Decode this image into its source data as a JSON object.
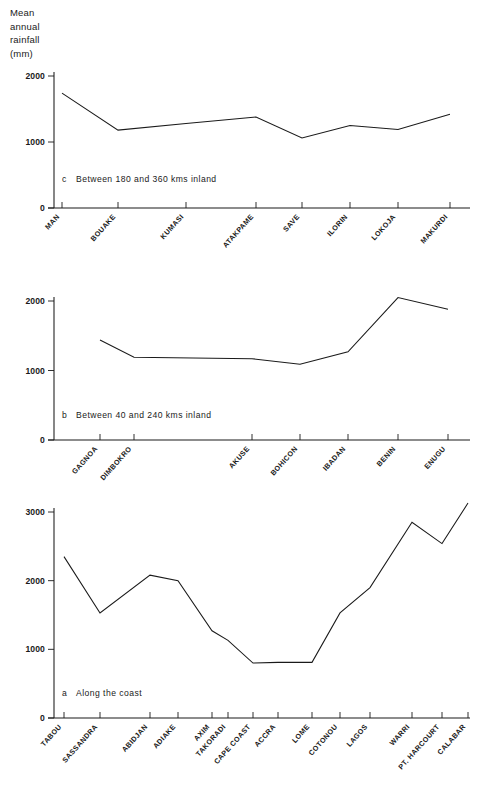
{
  "figure": {
    "y_axis_title": "Mean\nannual\nrainfall\n(mm)"
  },
  "chart_data": [
    {
      "id": "c",
      "type": "line",
      "title": "c   Between 180 and 360 kms inland",
      "caption_letter": "c",
      "caption_text": "Between  180  and  360  kms  inland",
      "xlabel": "",
      "ylabel": "Mean annual rainfall (mm)",
      "ylim": [
        0,
        2000
      ],
      "yticks": [
        0,
        1000,
        2000
      ],
      "ytick_labels": [
        "0",
        "1000",
        "2000"
      ],
      "grid": false,
      "legend": "none",
      "categories": [
        "MAN",
        "BOUAKE",
        "KUMASI",
        "ATAKPAME",
        "SAVE",
        "ILORIN",
        "LOKOJA",
        "MAKURDI"
      ],
      "values": [
        1740,
        1180,
        1280,
        1380,
        1060,
        1250,
        1190,
        1420
      ]
    },
    {
      "id": "b",
      "type": "line",
      "title": "b   Between 40 and 240 kms inland",
      "caption_letter": "b",
      "caption_text": "Between  40  and  240  kms  inland",
      "xlabel": "",
      "ylabel": "Mean annual rainfall (mm)",
      "ylim": [
        0,
        2000
      ],
      "yticks": [
        0,
        1000,
        2000
      ],
      "ytick_labels": [
        "0",
        "1000",
        "2000"
      ],
      "grid": false,
      "legend": "none",
      "categories": [
        "GAGNOA",
        "DIMBOKRO",
        "AKUSE",
        "BOHICON",
        "IBADAN",
        "BENIN",
        "ENUGU"
      ],
      "values": [
        1440,
        1190,
        1170,
        1090,
        1270,
        2050,
        1880
      ]
    },
    {
      "id": "a",
      "type": "line",
      "title": "a   Along the coast",
      "caption_letter": "a",
      "caption_text": "Along  the  coast",
      "xlabel": "",
      "ylabel": "Mean annual rainfall (mm)",
      "ylim": [
        0,
        3000
      ],
      "yticks": [
        0,
        1000,
        2000,
        3000
      ],
      "ytick_labels": [
        "0",
        "1000",
        "2000",
        "3000"
      ],
      "grid": false,
      "legend": "none",
      "categories": [
        "TABOU",
        "SASSANDRA",
        "ABIDJAN",
        "ADIAKE",
        "AXIM",
        "TAKORADI",
        "CAPE COAST",
        "ACCRA",
        "LOME",
        "COTONOU",
        "LAGOS",
        "WARRI",
        "PT. HARCOURT",
        "CALABAR"
      ],
      "values": [
        2350,
        1530,
        2080,
        2000,
        1270,
        1130,
        800,
        810,
        810,
        1530,
        1900,
        2850,
        2540,
        3130
      ]
    }
  ]
}
